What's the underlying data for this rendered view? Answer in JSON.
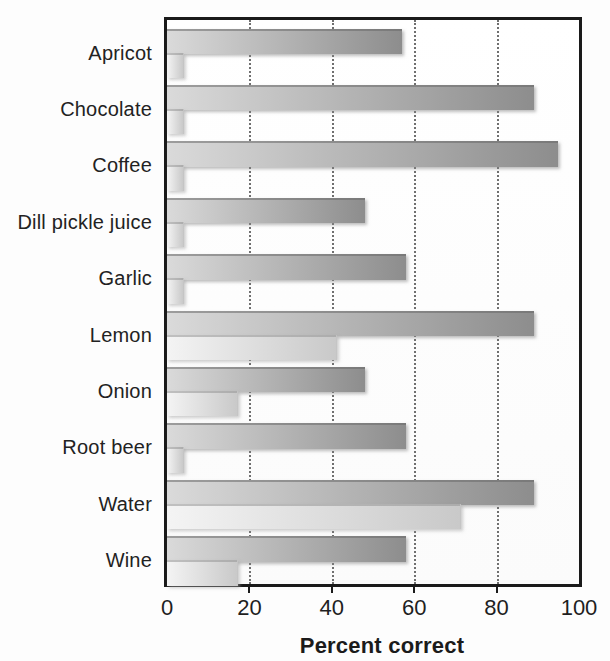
{
  "chart_data": {
    "type": "bar",
    "orientation": "horizontal",
    "title": "",
    "xlabel": "Percent correct",
    "ylabel": "",
    "xlim": [
      0,
      100
    ],
    "x_ticks": [
      0,
      20,
      40,
      60,
      80,
      100
    ],
    "gridlines_at": [
      20,
      40,
      60,
      80
    ],
    "grid_style": "vertical dotted lines",
    "legend": "none",
    "categories": [
      "Apricot",
      "Chocolate",
      "Coffee",
      "Dill pickle juice",
      "Garlic",
      "Lemon",
      "Onion",
      "Root beer",
      "Water",
      "Wine"
    ],
    "series": [
      {
        "name": "upper-dark-bar",
        "values": [
          57,
          89,
          95,
          48,
          58,
          89,
          48,
          58,
          89,
          58
        ]
      },
      {
        "name": "lower-light-bar",
        "values": [
          4,
          4,
          4,
          4,
          4,
          41,
          17,
          4,
          71,
          17
        ]
      }
    ]
  },
  "colors": {
    "dark_bar_start": "#dadada",
    "dark_bar_end": "#8d8d8d",
    "light_bar_start": "#f4f4f4",
    "light_bar_end": "#c9c9c9",
    "frame": "#1a1a1a",
    "grid": "#6f6f6f",
    "text": "#1f1f1f",
    "background": "#fdfdfd"
  }
}
